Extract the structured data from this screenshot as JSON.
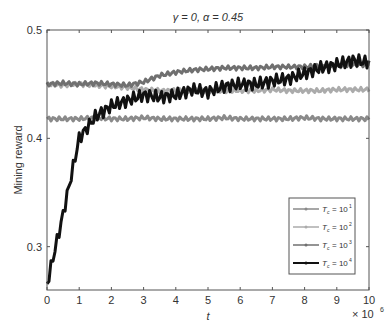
{
  "chart_data": {
    "type": "line",
    "title": "γ = 0,  α = 0.45",
    "xlabel": "t",
    "ylabel": "Mining reward",
    "x_multiplier": "× 10^6",
    "xlim": [
      0,
      10
    ],
    "ylim": [
      0.26,
      0.5
    ],
    "xticks": [
      0,
      1,
      2,
      3,
      4,
      5,
      6,
      7,
      8,
      9,
      10
    ],
    "yticks": [
      0.3,
      0.4,
      0.5
    ],
    "x": [
      0,
      0.5,
      1,
      1.5,
      2,
      2.5,
      3,
      3.5,
      4,
      4.5,
      5,
      5.5,
      6,
      6.5,
      7,
      7.5,
      8,
      8.5,
      9,
      9.5,
      10
    ],
    "series": [
      {
        "name": "T_c = 10^1",
        "color": "#8a8a8a",
        "values": [
          0.418,
          0.418,
          0.418,
          0.419,
          0.418,
          0.418,
          0.419,
          0.418,
          0.418,
          0.418,
          0.418,
          0.419,
          0.418,
          0.418,
          0.418,
          0.418,
          0.419,
          0.418,
          0.418,
          0.418,
          0.418
        ]
      },
      {
        "name": "T_c = 10^2",
        "color": "#ababab",
        "values": [
          0.45,
          0.449,
          0.45,
          0.449,
          0.448,
          0.447,
          0.445,
          0.444,
          0.444,
          0.444,
          0.444,
          0.444,
          0.444,
          0.444,
          0.445,
          0.444,
          0.444,
          0.444,
          0.445,
          0.445,
          0.445
        ]
      },
      {
        "name": "T_c = 10^3",
        "color": "#707070",
        "values": [
          0.45,
          0.451,
          0.45,
          0.451,
          0.45,
          0.449,
          0.452,
          0.458,
          0.461,
          0.463,
          0.464,
          0.465,
          0.465,
          0.465,
          0.466,
          0.466,
          0.466,
          0.467,
          0.467,
          0.468,
          0.468
        ]
      },
      {
        "name": "T_c = 10^4",
        "color": "#111111",
        "values": [
          0.265,
          0.33,
          0.4,
          0.42,
          0.43,
          0.435,
          0.44,
          0.438,
          0.44,
          0.445,
          0.443,
          0.448,
          0.45,
          0.45,
          0.453,
          0.455,
          0.46,
          0.465,
          0.468,
          0.472,
          0.47
        ]
      }
    ],
    "legend_position": "lower right",
    "legend": [
      "T_c = 10^1",
      "T_c = 10^2",
      "T_c = 10^3",
      "T_c = 10^4"
    ]
  }
}
